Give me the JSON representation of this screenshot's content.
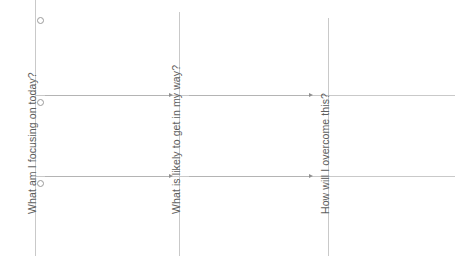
{
  "worksheet": {
    "title": "Daily Focus Reflection Worksheet",
    "columns": [
      {
        "id": "focus",
        "prompt": "What am I focusing on today?",
        "label_left": 26,
        "label_bottom": 214,
        "divider_x": 35,
        "divider_top": 0,
        "divider_bottom": 256
      },
      {
        "id": "obstacle",
        "prompt": "What is likely to get in my way?",
        "label_left": 170,
        "label_bottom": 214,
        "divider_x": 179,
        "divider_top": 12,
        "divider_bottom": 256
      },
      {
        "id": "overcome",
        "prompt": "How will I overcome this?",
        "label_left": 319,
        "label_bottom": 214,
        "divider_x": 328,
        "divider_top": 18,
        "divider_bottom": 256
      }
    ],
    "bullets": [
      {
        "id": "bullet-row-1",
        "x": 37,
        "y": 17
      },
      {
        "id": "bullet-row-2",
        "x": 37,
        "y": 99
      },
      {
        "id": "bullet-row-3",
        "x": 37,
        "y": 180
      }
    ],
    "rules": [
      {
        "id": "rule-row-2",
        "x": 36,
        "y": 95,
        "width": 419
      },
      {
        "id": "rule-row-3",
        "x": 36,
        "y": 176,
        "width": 419
      }
    ],
    "arrows": [
      {
        "id": "arrow-focus-to-obstacle",
        "x": 45,
        "y": 95,
        "length": 124
      },
      {
        "id": "arrow-obstacle-to-overcome",
        "x": 189,
        "y": 95,
        "length": 120
      },
      {
        "id": "arrow-focus-to-obstacle-row3",
        "x": 45,
        "y": 176,
        "length": 124
      },
      {
        "id": "arrow-obstacle-to-overcome-row3",
        "x": 189,
        "y": 176,
        "length": 120
      }
    ],
    "colors": {
      "line": "#c9c9c9",
      "arrow": "#b4b4b4",
      "arrow_head": "#8f8f8f",
      "text": "#5e5e5e",
      "bullet_stroke": "#9a9a9a",
      "background": "#ffffff"
    }
  }
}
